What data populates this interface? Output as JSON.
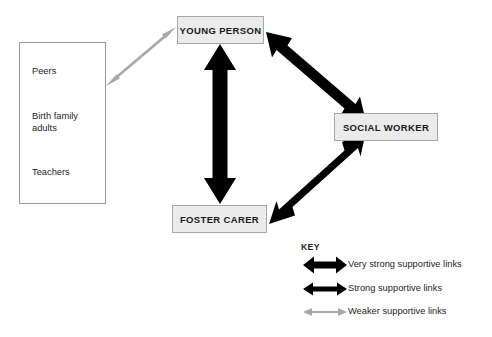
{
  "diagram": {
    "nodes": [
      {
        "id": "young-person",
        "label": "YOUNG PERSON"
      },
      {
        "id": "social-worker",
        "label": "SOCIAL WORKER"
      },
      {
        "id": "foster-carer",
        "label": "FOSTER CARER"
      }
    ],
    "network_box": {
      "items": [
        {
          "label": "Peers"
        },
        {
          "label": "Birth family\nadults"
        },
        {
          "label": "Teachers"
        }
      ]
    },
    "links": [
      {
        "id": "young-person--foster-carer",
        "from": "YOUNG PERSON",
        "to": "FOSTER CARER",
        "strength": "Very strong supportive links",
        "color": "#000000",
        "double_headed": true
      },
      {
        "id": "young-person--social-worker",
        "from": "YOUNG PERSON",
        "to": "SOCIAL WORKER",
        "strength": "Strong supportive links",
        "color": "#000000",
        "double_headed": true
      },
      {
        "id": "foster-carer--social-worker",
        "from": "FOSTER CARER",
        "to": "SOCIAL WORKER",
        "strength": "Strong supportive links",
        "color": "#000000",
        "double_headed": true
      },
      {
        "id": "network--young-person",
        "from": "Peers / Birth family adults / Teachers",
        "to": "YOUNG PERSON",
        "strength": "Weaker supportive links",
        "color": "#a8a8a8",
        "double_headed": true
      }
    ],
    "legend": {
      "title": "KEY",
      "entries": [
        {
          "label": "Very strong supportive links",
          "color": "#000000",
          "weight": "very-strong"
        },
        {
          "label": "Strong supportive links",
          "color": "#000000",
          "weight": "strong"
        },
        {
          "label": "Weaker supportive links",
          "color": "#a8a8a8",
          "weight": "weak"
        }
      ]
    },
    "colors": {
      "box_fill": "#ebebeb",
      "box_border": "#a6a6a6",
      "network_border": "#9a9a9a",
      "strong_arrow": "#000000",
      "weak_arrow": "#a8a8a8",
      "background": "#ffffff",
      "text": "#231f20"
    }
  }
}
